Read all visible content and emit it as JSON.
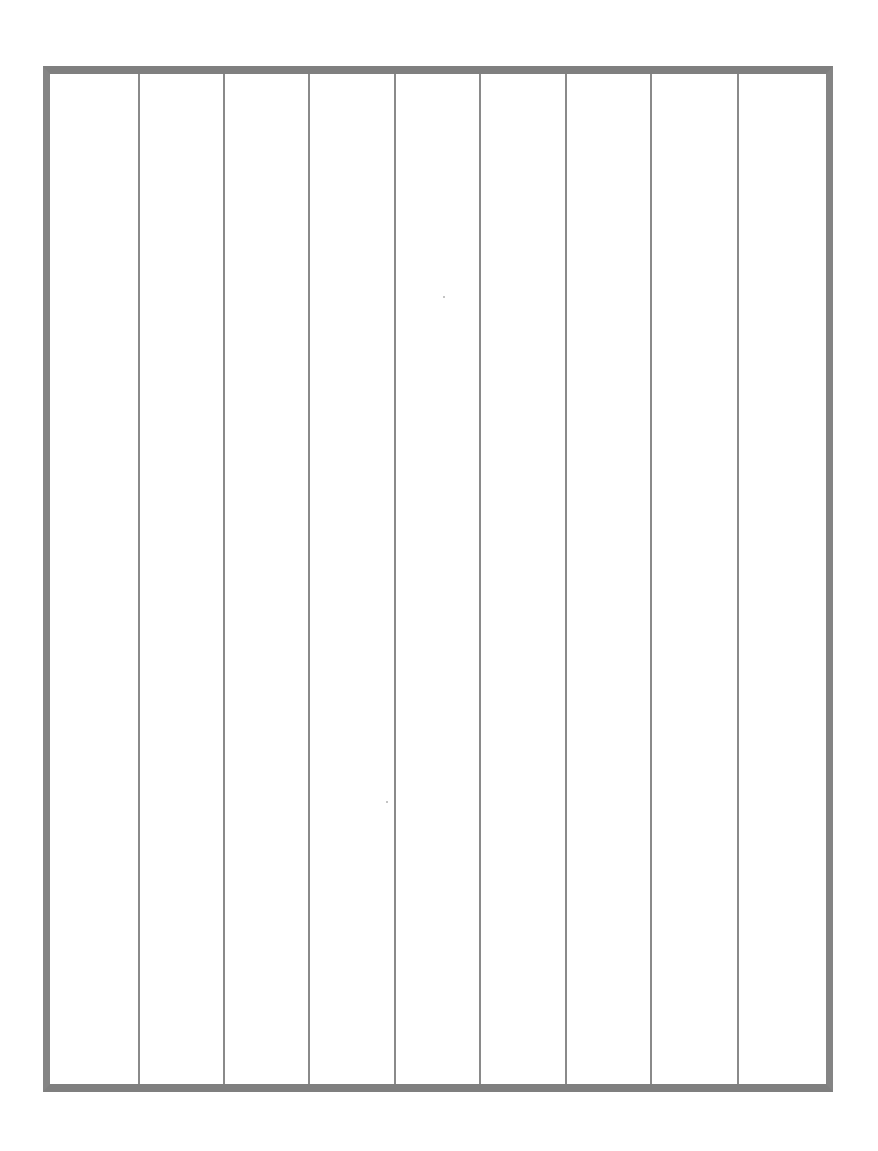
{
  "document": {
    "type": "blank ruled grid sheet",
    "columns": 10,
    "border_color": "#7f7f7f",
    "line_color": "#8a8a8a",
    "background": "#ffffff",
    "column_line_positions_px": [
      139,
      224,
      309,
      395,
      480,
      566,
      651,
      738
    ]
  }
}
